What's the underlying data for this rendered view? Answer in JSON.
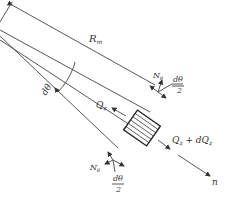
{
  "diagram": {
    "labels": {
      "radius": "R",
      "radius_sub": "m",
      "d_theta": "dθ",
      "n_theta_top": "N",
      "n_theta_top_sub": "θ",
      "d_theta_half_top_num": "dθ",
      "d_theta_half_top_den": "2",
      "q_left": "Q",
      "q_left_sub": "z",
      "q_right": "Q",
      "q_right_sub": "z",
      "q_right_plus": " + dQ",
      "q_right_plus_sub": "z",
      "n_theta_bottom": "N",
      "n_theta_bottom_sub": "θ",
      "d_theta_half_bottom_num": "dθ",
      "d_theta_half_bottom_den": "2",
      "normal_axis": "n"
    },
    "colors": {
      "line": "#444444",
      "text": "#333333",
      "background": "#ffffff"
    }
  }
}
